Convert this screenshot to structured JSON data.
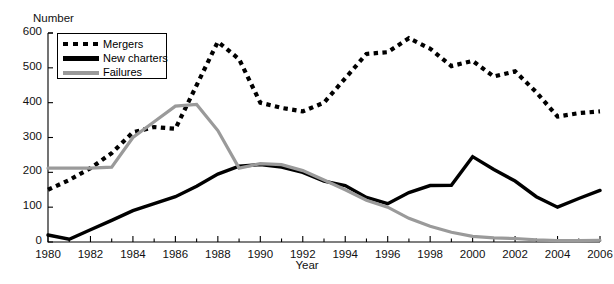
{
  "caption_fragment": "",
  "axes": {
    "ylabel": "Number",
    "xlabel": "Year",
    "y_ticks": [
      0,
      100,
      200,
      300,
      400,
      500,
      600
    ],
    "x_ticks": [
      1980,
      1982,
      1984,
      1986,
      1988,
      1990,
      1992,
      1994,
      1996,
      1998,
      2000,
      2002,
      2004,
      2006
    ]
  },
  "legend": {
    "position": "top-left-inside",
    "items": [
      {
        "label": "Mergers",
        "key": "dotted-black",
        "color": "#000000"
      },
      {
        "label": "New charters",
        "key": "solid-black",
        "color": "#000000"
      },
      {
        "label": "Failures",
        "key": "solid-gray",
        "color": "#9a9a9a"
      }
    ]
  },
  "chart_data": {
    "type": "line",
    "title": "",
    "xlabel": "Year",
    "ylabel": "Number",
    "xlim": [
      1980,
      2006
    ],
    "ylim": [
      0,
      600
    ],
    "grid": false,
    "legend_position": "upper left",
    "x": [
      1980,
      1981,
      1982,
      1983,
      1984,
      1985,
      1986,
      1987,
      1988,
      1989,
      1990,
      1991,
      1992,
      1993,
      1994,
      1995,
      1996,
      1997,
      1998,
      1999,
      2000,
      2001,
      2002,
      2003,
      2004,
      2005,
      2006
    ],
    "series": [
      {
        "name": "Mergers",
        "style": "dotted",
        "color": "#000000",
        "values": [
          150,
          178,
          212,
          255,
          315,
          330,
          325,
          450,
          575,
          525,
          400,
          385,
          375,
          400,
          470,
          540,
          545,
          585,
          555,
          505,
          520,
          475,
          490,
          430,
          360,
          370,
          375
        ]
      },
      {
        "name": "New charters",
        "style": "solid",
        "color": "#000000",
        "values": [
          20,
          8,
          35,
          62,
          90,
          110,
          130,
          160,
          195,
          218,
          222,
          215,
          200,
          175,
          162,
          128,
          110,
          142,
          162,
          163,
          245,
          208,
          175,
          130,
          100,
          125,
          148
        ]
      },
      {
        "name": "Failures",
        "style": "solid",
        "color": "#9a9a9a",
        "values": [
          212,
          212,
          212,
          215,
          300,
          345,
          390,
          395,
          320,
          212,
          225,
          222,
          205,
          178,
          150,
          120,
          100,
          68,
          45,
          28,
          16,
          12,
          10,
          6,
          4,
          4,
          5
        ]
      }
    ]
  }
}
